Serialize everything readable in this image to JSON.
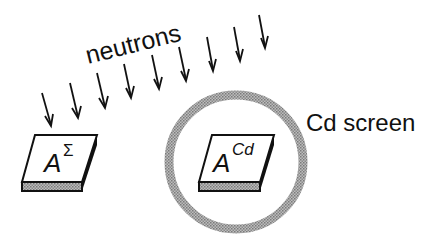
{
  "diagram": {
    "beam_label": "neutrons",
    "screen_label": "Cd screen",
    "samples": [
      {
        "base": "A",
        "superscript": "Σ"
      },
      {
        "base": "A",
        "superscript": "Cd"
      }
    ],
    "arrow_count": 9,
    "colors": {
      "ink": "#111111",
      "screen_ring": "#9a9a9a",
      "sample_side": "#a8a8a8",
      "background": "#ffffff"
    }
  }
}
